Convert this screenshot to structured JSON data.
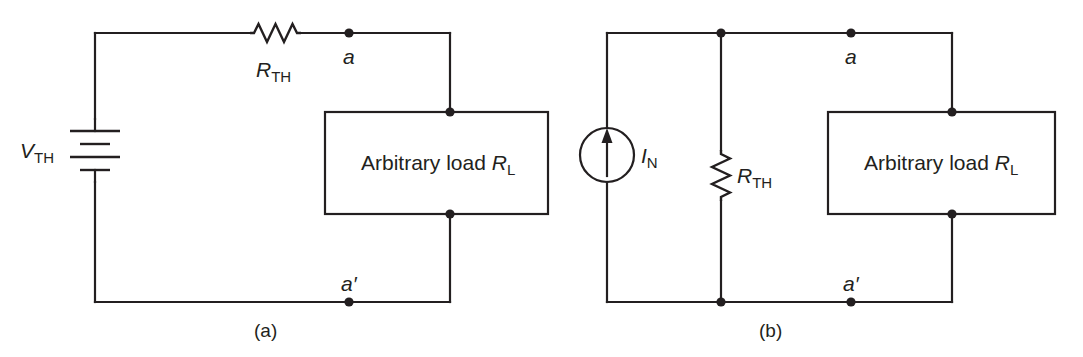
{
  "figure": {
    "background_color": "#ffffff",
    "line_color": "#231f20"
  },
  "panels": [
    {
      "id": "a",
      "caption": "(a)",
      "type": "thevenin-equivalent",
      "source": {
        "kind": "voltage-source-battery",
        "symbol": "battery-icon",
        "label_main": "V",
        "label_sub": "TH",
        "plates": 4
      },
      "series_resistor": {
        "kind": "resistor-horizontal",
        "symbol": "resistor-zigzag-icon",
        "label_main": "R",
        "label_sub": "TH"
      },
      "terminals": [
        {
          "name": "a",
          "label": "a",
          "position": "top"
        },
        {
          "name": "a-prime",
          "label": "a′",
          "position": "bottom"
        }
      ],
      "load": {
        "text_main": "Arbitrary load ",
        "text_var": "R",
        "text_sub": "L"
      }
    },
    {
      "id": "b",
      "caption": "(b)",
      "type": "norton-equivalent",
      "source": {
        "kind": "current-source",
        "symbol": "current-source-circle-arrow-icon",
        "label_main": "I",
        "label_sub": "N",
        "arrow_direction": "up"
      },
      "shunt_resistor": {
        "kind": "resistor-vertical",
        "symbol": "resistor-zigzag-icon",
        "label_main": "R",
        "label_sub": "TH"
      },
      "terminals": [
        {
          "name": "a",
          "label": "a",
          "position": "top"
        },
        {
          "name": "a-prime",
          "label": "a′",
          "position": "bottom"
        }
      ],
      "load": {
        "text_main": "Arbitrary load ",
        "text_var": "R",
        "text_sub": "L"
      }
    }
  ]
}
